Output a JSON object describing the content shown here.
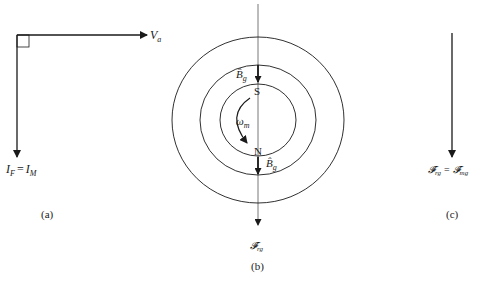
{
  "panels": {
    "a": {
      "caption": "(a)",
      "voltage_label": "V",
      "voltage_sub": "a",
      "current_label_lhs": "I",
      "current_lhs_sub": "F",
      "equals": "=",
      "current_label_rhs": "I",
      "current_rhs_sub": "M"
    },
    "b": {
      "caption": "(b)",
      "south_pole": "S",
      "north_pole": "N",
      "speed_label": "ω",
      "speed_sub": "m",
      "flux_top_label": "B̂",
      "flux_top_sub": "g",
      "flux_bottom_label": "B̂",
      "flux_bottom_sub": "g",
      "mmf_label": "𝓕̂",
      "mmf_sub": "rg"
    },
    "c": {
      "caption": "(c)",
      "mmf_lhs": "𝓕̂",
      "mmf_lhs_sub": "rg",
      "equals": "=",
      "mmf_rhs": "𝓕̂",
      "mmf_rhs_sub": "mg"
    }
  },
  "colors": {
    "line": "#1a1a1a",
    "thin_line": "#555555",
    "background": "#ffffff"
  }
}
